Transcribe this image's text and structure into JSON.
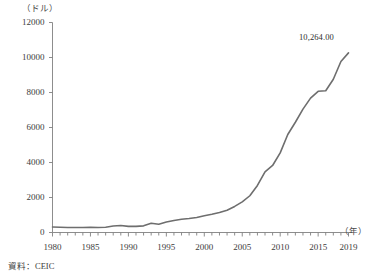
{
  "chart_data": {
    "type": "line",
    "title": "",
    "xlabel": "（年）",
    "ylabel": "（ドル）",
    "y_unit_label": "（ドル）",
    "x_unit_label": "（年）",
    "xlim": [
      1980,
      2019
    ],
    "ylim": [
      0,
      12000
    ],
    "grid": false,
    "legend": "none",
    "line_color": "#6e6e6e",
    "axis_color": "#808080",
    "text_color": "#3c3c3c",
    "yticks": [
      0,
      2000,
      4000,
      6000,
      8000,
      10000,
      12000
    ],
    "ytick_labels": [
      "0",
      "2000",
      "4000",
      "6000",
      "8000",
      "10000",
      "12000"
    ],
    "xticks": [
      1980,
      1985,
      1990,
      1995,
      2000,
      2005,
      2010,
      2015,
      2019
    ],
    "xtick_labels": [
      "1980",
      "1985",
      "1990",
      "1995",
      "2000",
      "2005",
      "2010",
      "2015",
      "2019"
    ],
    "x_minor_tick_interval": 1,
    "annotations": [
      {
        "text": "10,264.00",
        "x": 2019,
        "y": 10264
      }
    ],
    "series": [
      {
        "name": "一人当たりGDP",
        "x": [
          1980,
          1981,
          1982,
          1983,
          1984,
          1985,
          1986,
          1987,
          1988,
          1989,
          1990,
          1991,
          1992,
          1993,
          1994,
          1995,
          1996,
          1997,
          1998,
          1999,
          2000,
          2001,
          2002,
          2003,
          2004,
          2005,
          2006,
          2007,
          2008,
          2009,
          2010,
          2011,
          2012,
          2013,
          2014,
          2015,
          2016,
          2017,
          2018,
          2019
        ],
        "values": [
          310,
          300,
          290,
          290,
          290,
          300,
          290,
          300,
          370,
          400,
          350,
          350,
          380,
          530,
          470,
          600,
          690,
          760,
          800,
          860,
          960,
          1040,
          1140,
          1270,
          1490,
          1750,
          2100,
          2690,
          3470,
          3830,
          4550,
          5600,
          6300,
          7050,
          7680,
          8070,
          8100,
          8760,
          9770,
          10264
        ]
      }
    ]
  },
  "source": {
    "label": "資料：CEIC"
  }
}
